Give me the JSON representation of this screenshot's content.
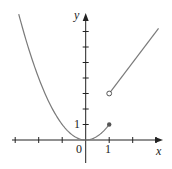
{
  "chart_data": {
    "type": "line",
    "title": "",
    "xlabel": "x",
    "ylabel": "y",
    "xlim": [
      -3.5,
      3.3
    ],
    "ylim": [
      -1.5,
      8.2
    ],
    "tick_labels": {
      "x": [
        "0",
        "1"
      ],
      "y": [
        "1"
      ]
    },
    "x_ticks": [
      -3,
      -2,
      -1,
      0,
      1,
      2,
      3
    ],
    "y_ticks": [
      1,
      2,
      3,
      4,
      5,
      6,
      7
    ],
    "grid": false,
    "series": [
      {
        "name": "y = x^2",
        "domain": [
          -2.85,
          1
        ],
        "formula": "x^2",
        "end": {
          "x": 1,
          "y": 1,
          "marker": "filled"
        }
      },
      {
        "name": "y = 2x + 1",
        "domain": [
          1,
          3.1
        ],
        "formula": "2x+1",
        "start": {
          "x": 1,
          "y": 3,
          "marker": "open"
        }
      }
    ]
  },
  "labels": {
    "x_axis": "x",
    "y_axis": "y",
    "origin": "0",
    "x_one": "1",
    "y_one": "1"
  },
  "colors": {
    "curve": "#7a7a7a",
    "axis": "#222222"
  }
}
